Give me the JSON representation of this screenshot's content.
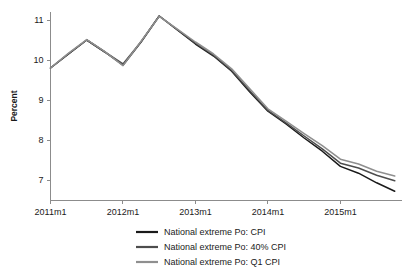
{
  "chart_data": {
    "type": "line",
    "title": "",
    "subtitle": "",
    "xlabel": "",
    "ylabel": "Percent",
    "ylim": [
      6.5,
      11.2
    ],
    "xlim": [
      2011.0,
      2015.85
    ],
    "grid": false,
    "legend_position": "bottom",
    "y_ticks": [
      "7",
      "8",
      "9",
      "10",
      "11"
    ],
    "y_tick_values": [
      7,
      8,
      9,
      10,
      11
    ],
    "x_ticks": [
      "2011m1",
      "2012m1",
      "2013m1",
      "2014m1",
      "2015m1"
    ],
    "x_tick_values": [
      2011.0,
      2012.0,
      2013.0,
      2014.0,
      2015.0
    ],
    "x": [
      2011.0,
      2011.25,
      2011.5,
      2011.75,
      2012.0,
      2012.25,
      2012.5,
      2012.75,
      2013.0,
      2013.25,
      2013.5,
      2013.75,
      2014.0,
      2014.25,
      2014.5,
      2014.75,
      2015.0,
      2015.25,
      2015.5,
      2015.75
    ],
    "series": [
      {
        "name": "National extreme Po: CPI",
        "color": "#1a1a1a",
        "values": [
          9.8,
          10.15,
          10.5,
          10.2,
          9.87,
          10.45,
          11.1,
          10.75,
          10.4,
          10.1,
          9.72,
          9.2,
          8.72,
          8.4,
          8.05,
          7.72,
          7.34,
          7.17,
          6.93,
          6.72
        ]
      },
      {
        "name": "National extreme Po: 40% CPI",
        "color": "#4d4d4d",
        "values": [
          9.8,
          10.16,
          10.5,
          10.2,
          9.9,
          10.46,
          11.1,
          10.76,
          10.42,
          10.12,
          9.74,
          9.23,
          8.74,
          8.43,
          8.1,
          7.78,
          7.42,
          7.3,
          7.12,
          6.98
        ]
      },
      {
        "name": "National extreme Po: Q1 CPI",
        "color": "#8f8f8f",
        "values": [
          9.8,
          10.17,
          10.51,
          10.21,
          9.86,
          10.47,
          11.09,
          10.77,
          10.45,
          10.15,
          9.78,
          9.28,
          8.78,
          8.47,
          8.16,
          7.86,
          7.52,
          7.4,
          7.22,
          7.1
        ]
      }
    ]
  },
  "legend": {
    "entries": [
      {
        "label": "National extreme Po: CPI",
        "color": "#1a1a1a"
      },
      {
        "label": "National extreme Po: 40% CPI",
        "color": "#4d4d4d"
      },
      {
        "label": "National extreme Po: Q1 CPI",
        "color": "#8f8f8f"
      }
    ]
  }
}
